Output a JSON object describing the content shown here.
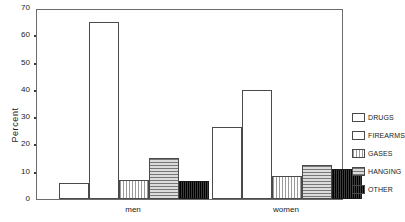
{
  "chart_data": {
    "type": "bar",
    "title": "",
    "xlabel": "",
    "ylabel": "Percent",
    "ylim": [
      0,
      70
    ],
    "yticks": [
      0,
      10,
      20,
      30,
      40,
      50,
      60,
      70
    ],
    "ytick_labels": [
      "0",
      "10",
      "20",
      "30",
      "40",
      "50",
      "60",
      "70"
    ],
    "grid": false,
    "legend_position": "right",
    "categories": [
      "men",
      "women"
    ],
    "series": [
      {
        "name": "DRUGS",
        "values": [
          6,
          26.5
        ],
        "fill": "open"
      },
      {
        "name": "FIREARMS",
        "values": [
          65,
          40
        ],
        "fill": "open"
      },
      {
        "name": "GASES",
        "values": [
          7,
          8.5
        ],
        "fill": "vhatch"
      },
      {
        "name": "HANGING",
        "values": [
          15,
          12.5
        ],
        "fill": "hhatch"
      },
      {
        "name": "OTHER",
        "values": [
          6.5,
          11
        ],
        "fill": "dark"
      }
    ]
  },
  "legend": {
    "items": [
      {
        "label": "DRUGS",
        "fill": "open"
      },
      {
        "label": "FIREARMS",
        "fill": "open"
      },
      {
        "label": "GASES",
        "fill": "vhatch"
      },
      {
        "label": "HANGING",
        "fill": "hhatch"
      },
      {
        "label": "OTHER",
        "fill": "dark"
      }
    ]
  }
}
